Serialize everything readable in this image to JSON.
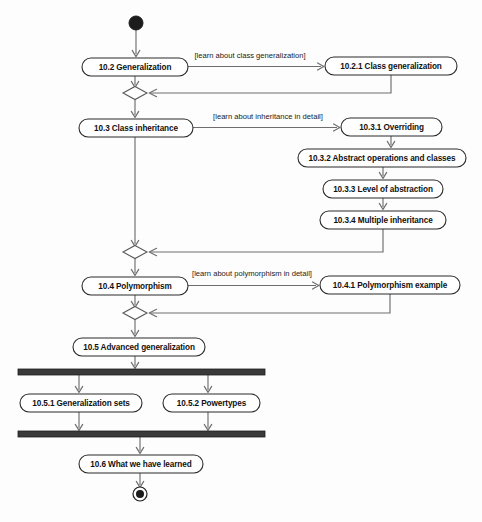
{
  "diagram": {
    "type": "uml-activity-diagram",
    "nodes": [
      {
        "id": "initial",
        "kind": "initial-node",
        "label": "",
        "cx": 136,
        "cy": 23,
        "r": 7
      },
      {
        "id": "n102",
        "kind": "activity",
        "label": "10.2 Generalization",
        "x": 82,
        "y": 58,
        "w": 106,
        "h": 18
      },
      {
        "id": "n1021",
        "kind": "activity",
        "label": "10.2.1 Class generalization",
        "x": 325,
        "y": 57,
        "w": 132,
        "h": 18
      },
      {
        "id": "d1",
        "kind": "decision",
        "label": "",
        "cx": 135,
        "cy": 93,
        "w": 24,
        "h": 13
      },
      {
        "id": "n103",
        "kind": "activity",
        "label": "10.3 Class inheritance",
        "x": 79,
        "y": 119,
        "w": 114,
        "h": 18
      },
      {
        "id": "n1031",
        "kind": "activity",
        "label": "10.3.1 Overriding",
        "x": 341,
        "y": 118,
        "w": 101,
        "h": 18
      },
      {
        "id": "n1032",
        "kind": "activity",
        "label": "10.3.2 Abstract operations and classes",
        "x": 298,
        "y": 149,
        "w": 168,
        "h": 18
      },
      {
        "id": "n1033",
        "kind": "activity",
        "label": "10.3.3 Level of abstraction",
        "x": 323,
        "y": 180,
        "w": 120,
        "h": 18
      },
      {
        "id": "n1034",
        "kind": "activity",
        "label": "10.3.4 Multiple inheritance",
        "x": 320,
        "y": 211,
        "w": 126,
        "h": 18
      },
      {
        "id": "d2",
        "kind": "decision",
        "label": "",
        "cx": 135,
        "cy": 252,
        "w": 24,
        "h": 13
      },
      {
        "id": "n104",
        "kind": "activity",
        "label": "10.4 Polymorphism",
        "x": 82,
        "y": 277,
        "w": 106,
        "h": 18
      },
      {
        "id": "n1041",
        "kind": "activity",
        "label": "10.4.1 Polymorphism example",
        "x": 320,
        "y": 276,
        "w": 140,
        "h": 18
      },
      {
        "id": "d3",
        "kind": "decision",
        "label": "",
        "cx": 135,
        "cy": 313,
        "w": 24,
        "h": 13
      },
      {
        "id": "n105",
        "kind": "activity",
        "label": "10.5 Advanced generalization",
        "x": 73,
        "y": 338,
        "w": 132,
        "h": 18
      },
      {
        "id": "fork",
        "kind": "fork-bar",
        "label": "",
        "x": 18,
        "y": 369,
        "w": 247,
        "h": 6
      },
      {
        "id": "n1051",
        "kind": "activity",
        "label": "10.5.1 Generalization sets",
        "x": 20,
        "y": 394,
        "w": 122,
        "h": 18
      },
      {
        "id": "n1052",
        "kind": "activity",
        "label": "10.5.2 Powertypes",
        "x": 163,
        "y": 394,
        "w": 97,
        "h": 18
      },
      {
        "id": "join",
        "kind": "join-bar",
        "label": "",
        "x": 18,
        "y": 431,
        "w": 247,
        "h": 6
      },
      {
        "id": "n106",
        "kind": "activity",
        "label": "10.6 What we have learned",
        "x": 79,
        "y": 455,
        "w": 124,
        "h": 18
      },
      {
        "id": "final",
        "kind": "final-node",
        "label": "",
        "cx": 140,
        "cy": 494,
        "r_outer": 7,
        "r_inner": 4
      }
    ],
    "guards": [
      {
        "id": "g1",
        "label": "[learn about class generalization]",
        "x": 250,
        "y": 56
      },
      {
        "id": "g2",
        "label": "[learn about inheritance in detail]",
        "x": 268,
        "y": 117
      },
      {
        "id": "g3",
        "label": "[learn about polymorphism in detail]",
        "x": 252,
        "y": 274
      }
    ],
    "colors": {
      "background": "#fdfdfd",
      "node_fill": "#ffffff",
      "node_stroke": "#2b2b2b",
      "flow_stroke": "#6e6e6e",
      "bar_fill": "#3a3a3a",
      "text": "#111111"
    }
  }
}
